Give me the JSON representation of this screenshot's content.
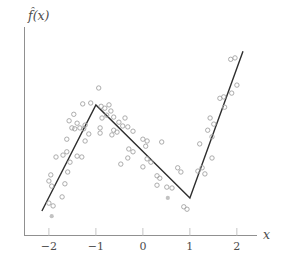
{
  "figure": {
    "y_axis_label": "f̂(x)",
    "x_axis_label": "x"
  },
  "colors": {
    "background": "#ffffff",
    "axis": "#909090",
    "tick": "#c6c6c6",
    "tick_label": "#4d4d4d",
    "fit_line": "#2e2e2e",
    "point_stroke": "#a3a3a3",
    "point_fill_solid": "#c2c2c2"
  },
  "chart_data": {
    "type": "scatter",
    "title": "",
    "xlabel": "x",
    "ylabel": "f̂(x)",
    "xlim": [
      -2.53,
      2.45
    ],
    "ylim": [
      0,
      4.47
    ],
    "grid": false,
    "legend": "none",
    "xticks": [
      {
        "value": -2,
        "label": "−2"
      },
      {
        "value": -1,
        "label": "−1"
      },
      {
        "value": 0,
        "label": "0"
      },
      {
        "value": 1,
        "label": "1"
      },
      {
        "value": 2,
        "label": "2"
      }
    ],
    "fit_line": {
      "name": "piecewise-linear-fit",
      "points": [
        [
          -2.15,
          0.51
        ],
        [
          -1.0,
          2.77
        ],
        [
          1.0,
          0.79
        ],
        [
          2.13,
          3.91
        ]
      ]
    },
    "points": [
      [
        -2.0,
        0.68
      ],
      [
        -1.91,
        0.62
      ],
      [
        -1.72,
        0.81
      ],
      [
        -1.66,
        1.09
      ],
      [
        -2.0,
        1.15
      ],
      [
        -1.94,
        1.04
      ],
      [
        -1.96,
        1.28
      ],
      [
        -1.6,
        1.34
      ],
      [
        -1.85,
        1.66
      ],
      [
        -1.7,
        1.7
      ],
      [
        -1.62,
        1.77
      ],
      [
        -1.3,
        1.66
      ],
      [
        -1.55,
        1.55
      ],
      [
        -1.4,
        1.68
      ],
      [
        -0.94,
        3.13
      ],
      [
        -1.28,
        2.79
      ],
      [
        -1.11,
        2.81
      ],
      [
        -0.89,
        2.74
      ],
      [
        -0.81,
        2.7
      ],
      [
        -0.72,
        2.77
      ],
      [
        -0.68,
        2.64
      ],
      [
        -0.62,
        2.51
      ],
      [
        -0.77,
        2.55
      ],
      [
        -0.87,
        2.49
      ],
      [
        -1.47,
        2.57
      ],
      [
        -1.57,
        2.43
      ],
      [
        -1.4,
        2.38
      ],
      [
        -1.51,
        2.28
      ],
      [
        -1.45,
        2.26
      ],
      [
        -1.34,
        2.28
      ],
      [
        -1.26,
        2.26
      ],
      [
        -1.15,
        2.15
      ],
      [
        -1.23,
        2.34
      ],
      [
        -1.62,
        2.04
      ],
      [
        -1.23,
        2.0
      ],
      [
        -0.91,
        2.28
      ],
      [
        -0.91,
        2.17
      ],
      [
        -0.66,
        2.13
      ],
      [
        -0.62,
        2.23
      ],
      [
        -0.55,
        2.19
      ],
      [
        -0.51,
        2.4
      ],
      [
        -0.38,
        2.49
      ],
      [
        -0.43,
        2.32
      ],
      [
        -0.32,
        2.3
      ],
      [
        -0.21,
        2.21
      ],
      [
        0.0,
        2.04
      ],
      [
        0.09,
        2.0
      ],
      [
        0.06,
        1.89
      ],
      [
        0.4,
        1.98
      ],
      [
        -0.3,
        1.83
      ],
      [
        -0.21,
        1.77
      ],
      [
        -0.47,
        1.51
      ],
      [
        -0.32,
        1.64
      ],
      [
        0.09,
        1.62
      ],
      [
        0.17,
        1.55
      ],
      [
        0.0,
        1.45
      ],
      [
        0.3,
        1.26
      ],
      [
        0.36,
        1.21
      ],
      [
        0.3,
        1.06
      ],
      [
        0.51,
        1.02
      ],
      [
        0.62,
        1.0
      ],
      [
        0.74,
        1.43
      ],
      [
        0.81,
        1.34
      ],
      [
        0.87,
        0.6
      ],
      [
        0.94,
        0.55
      ],
      [
        1.17,
        1.36
      ],
      [
        1.26,
        1.43
      ],
      [
        1.32,
        1.3
      ],
      [
        1.47,
        1.64
      ],
      [
        1.21,
        1.94
      ],
      [
        1.47,
        2.09
      ],
      [
        1.38,
        2.23
      ],
      [
        1.51,
        2.36
      ],
      [
        1.43,
        2.49
      ],
      [
        1.74,
        2.72
      ],
      [
        1.64,
        2.91
      ],
      [
        1.72,
        2.94
      ],
      [
        1.87,
        3.74
      ],
      [
        1.96,
        3.77
      ],
      [
        2.0,
        3.19
      ],
      [
        1.89,
        3.02
      ]
    ],
    "solid_points": [
      [
        -1.94,
        0.4
      ],
      [
        0.53,
        0.79
      ]
    ]
  }
}
